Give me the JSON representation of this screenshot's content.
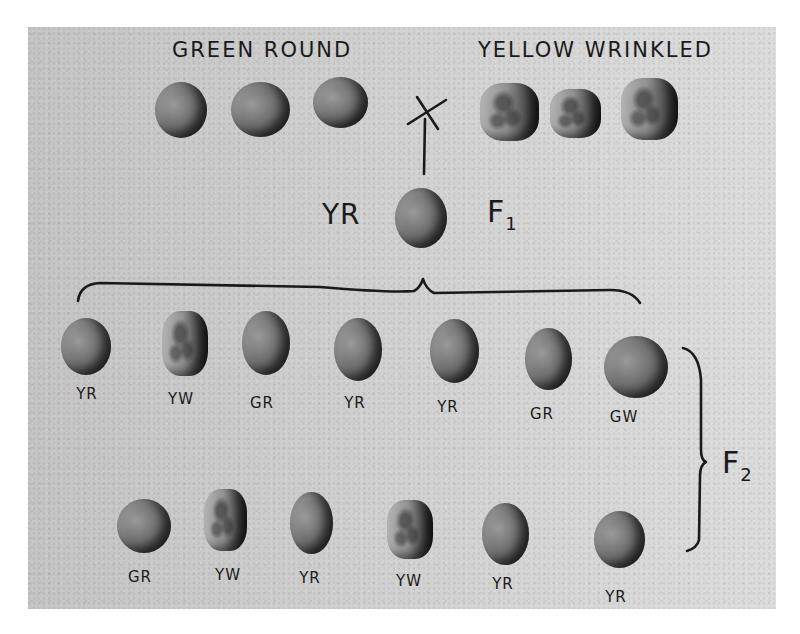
{
  "figure": {
    "parents": {
      "left_label": "GREEN ROUND",
      "right_label": "YELLOW WRINKLED",
      "cross_symbol": "X",
      "left_peas": [
        {
          "type": "round",
          "x": 155,
          "y": 82,
          "w": 52,
          "h": 56
        },
        {
          "type": "round",
          "x": 231,
          "y": 82,
          "w": 59,
          "h": 55
        },
        {
          "type": "round",
          "x": 313,
          "y": 77,
          "w": 55,
          "h": 51
        }
      ],
      "right_peas": [
        {
          "type": "wrinkled",
          "x": 480,
          "y": 83,
          "w": 59,
          "h": 58
        },
        {
          "type": "wrinkled",
          "x": 550,
          "y": 89,
          "w": 51,
          "h": 49
        },
        {
          "type": "wrinkled",
          "x": 621,
          "y": 78,
          "w": 57,
          "h": 62
        }
      ]
    },
    "f1": {
      "generation_label": "F",
      "generation_sub": "1",
      "phenotype_label": "YR",
      "pea": {
        "type": "round",
        "x": 395,
        "y": 188,
        "w": 52,
        "h": 60
      }
    },
    "f2": {
      "generation_label": "F",
      "generation_sub": "2",
      "row1": [
        {
          "label": "YR",
          "type": "round",
          "x": 61,
          "y": 318,
          "w": 50,
          "h": 57,
          "lx": 87,
          "ly": 385
        },
        {
          "label": "YW",
          "type": "wrinkled",
          "x": 162,
          "y": 311,
          "w": 46,
          "h": 65,
          "lx": 181,
          "ly": 390
        },
        {
          "label": "GR",
          "type": "round",
          "x": 242,
          "y": 311,
          "w": 48,
          "h": 64,
          "lx": 262,
          "ly": 394
        },
        {
          "label": "YR",
          "type": "round",
          "x": 334,
          "y": 318,
          "w": 48,
          "h": 63,
          "lx": 355,
          "ly": 394
        },
        {
          "label": "YR",
          "type": "round",
          "x": 430,
          "y": 319,
          "w": 49,
          "h": 64,
          "lx": 448,
          "ly": 398
        },
        {
          "label": "GR",
          "type": "round",
          "x": 525,
          "y": 328,
          "w": 47,
          "h": 62,
          "lx": 542,
          "ly": 405
        },
        {
          "label": "GW",
          "type": "round",
          "x": 604,
          "y": 336,
          "w": 64,
          "h": 62,
          "lx": 624,
          "ly": 408
        }
      ],
      "row2": [
        {
          "label": "GR",
          "type": "round",
          "x": 117,
          "y": 499,
          "w": 54,
          "h": 54,
          "lx": 140,
          "ly": 568
        },
        {
          "label": "YW",
          "type": "wrinkled",
          "x": 204,
          "y": 489,
          "w": 43,
          "h": 62,
          "lx": 228,
          "ly": 566
        },
        {
          "label": "YR",
          "type": "round",
          "x": 290,
          "y": 492,
          "w": 43,
          "h": 62,
          "lx": 310,
          "ly": 569
        },
        {
          "label": "YW",
          "type": "wrinkled",
          "x": 387,
          "y": 500,
          "w": 46,
          "h": 59,
          "lx": 409,
          "ly": 572
        },
        {
          "label": "YR",
          "type": "round",
          "x": 482,
          "y": 503,
          "w": 47,
          "h": 62,
          "lx": 503,
          "ly": 575
        },
        {
          "label": "YR",
          "type": "round",
          "x": 594,
          "y": 511,
          "w": 51,
          "h": 57,
          "lx": 616,
          "ly": 588
        }
      ]
    },
    "colors": {
      "ink": "#1a1a1a",
      "background_left": "#c4c4c4",
      "background_right": "#dcdcdc",
      "page": "#ffffff"
    }
  }
}
